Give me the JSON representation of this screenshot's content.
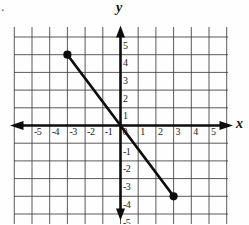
{
  "figure": {
    "corner_mark": ".",
    "axis_labels": {
      "x": "x",
      "y": "y"
    },
    "colors": {
      "background": "#fefefe",
      "grid": "#3f3f3f",
      "axis": "#0d0d0d",
      "segment": "#0d0d0d",
      "tick_text": "#1c1c1c"
    }
  },
  "chart_data": {
    "type": "line",
    "title": "",
    "xlabel": "x",
    "ylabel": "y",
    "xlim": [
      -5,
      5
    ],
    "ylim": [
      -5,
      5
    ],
    "grid": true,
    "x_ticks": [
      -5,
      -4,
      -3,
      -2,
      -1,
      0,
      1,
      2,
      3,
      4,
      5
    ],
    "y_ticks": [
      5,
      4,
      3,
      2,
      1,
      -1,
      -2,
      -3,
      -4,
      -5
    ],
    "series": [
      {
        "name": "segment",
        "points": [
          [
            -3,
            4
          ],
          [
            3,
            -4
          ]
        ],
        "endpoints_marked": true,
        "slope": -1.3333,
        "y_intercept": 0
      }
    ]
  }
}
